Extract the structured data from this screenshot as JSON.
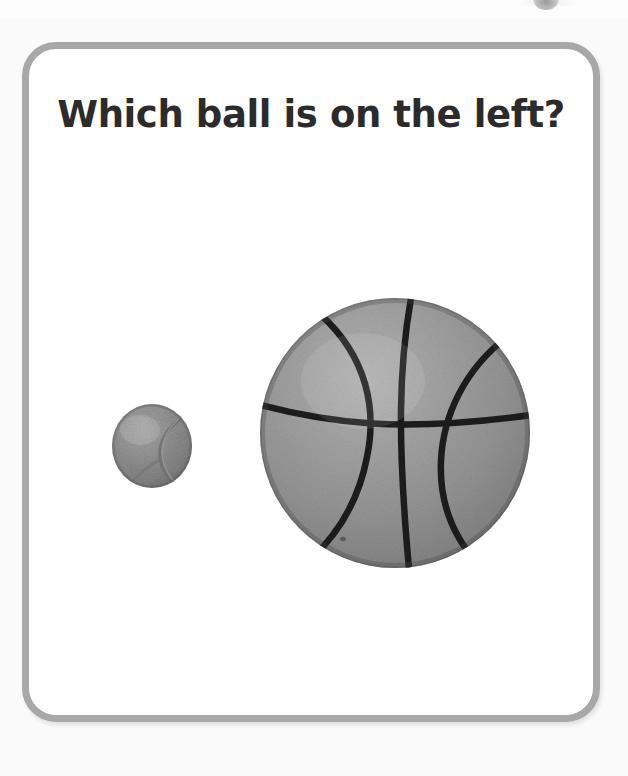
{
  "page": {
    "background_color": "#fafafa",
    "card_border_color": "#a8a8a8",
    "card_background_color": "#ffffff"
  },
  "card": {
    "title": "Which ball is on the left?"
  },
  "scene": {
    "objects": [
      {
        "name": "tennis-ball",
        "label": "tennis ball",
        "position": "left",
        "size": "small",
        "color": "#8f8f8f",
        "seam_color": "#6a6a6a"
      },
      {
        "name": "basketball",
        "label": "basketball",
        "position": "right",
        "size": "large",
        "color": "#969696",
        "seam_color": "#1b1b1b"
      }
    ]
  }
}
